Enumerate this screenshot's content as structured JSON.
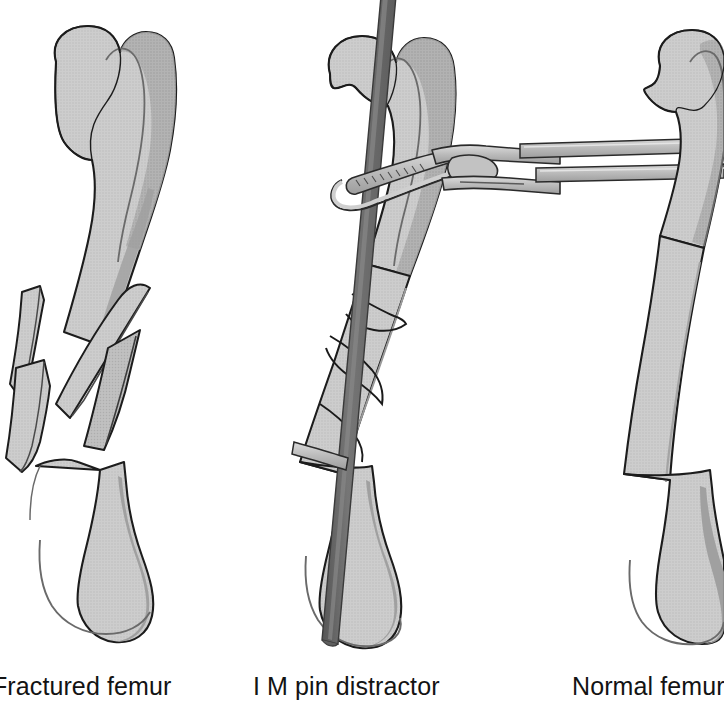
{
  "figure": {
    "kind": "medical-illustration",
    "background_color": "#ffffff",
    "width_px": 724,
    "height_px": 715
  },
  "palette": {
    "bone_fill": "#c9c9c9",
    "bone_fill_light": "#d2d2d2",
    "bone_shadow": "#a9a9a9",
    "bone_shadow_deep": "#8f8f8f",
    "bone_outline": "#1c1c1c",
    "inner_line": "#6a6a6a",
    "pin_fill": "#6e6e6e",
    "pin_edge": "#3a3a3a",
    "instrument_fill": "#b5b5b5",
    "instrument_highlight": "#d8d8d8",
    "instrument_outline": "#2a2a2a",
    "caption_color": "#131313"
  },
  "panels": [
    {
      "id": "fractured-femur",
      "order": 1,
      "caption": "Fractured femur",
      "caption_truncated_at_left_edge": true,
      "center_x": 120,
      "features": [
        "femoral head",
        "greater trochanter",
        "femoral neck",
        "shaft",
        "comminuted mid-shaft fracture",
        "butterfly fragments",
        "distal condyles"
      ],
      "fracture_fragments": 4,
      "has_implant": false
    },
    {
      "id": "im-pin-distractor",
      "order": 2,
      "caption": "I M pin distractor",
      "caption_truncated_at_left_edge": false,
      "center_x": 400,
      "features": [
        "femoral head",
        "greater trochanter",
        "intramedullary pin entering through trochanter",
        "distractor clamp around proximal shaft",
        "ratcheted clamp jaw",
        "twin instrument handles exiting right edge",
        "reduced fracture lines",
        "distal condyles"
      ],
      "fracture_fragments": 3,
      "has_implant": true,
      "implant_name": "intramedullary pin"
    },
    {
      "id": "normal-femur",
      "order": 3,
      "caption": "Normal femur",
      "caption_truncated_at_left_edge": false,
      "center_x": 640,
      "features": [
        "femoral head",
        "greater trochanter",
        "femoral neck",
        "intact shaft",
        "distal condyles"
      ],
      "fracture_fragments": 0,
      "has_implant": false,
      "cropped_at_right_edge": true
    }
  ],
  "captions": {
    "fractured": "Fractured femur",
    "distractor": "I M pin distractor",
    "normal": "Normal femur"
  }
}
